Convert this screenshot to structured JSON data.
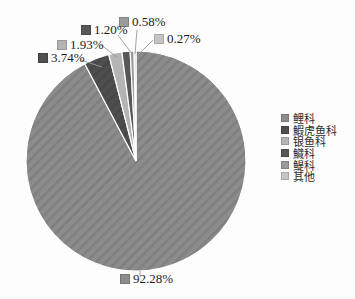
{
  "figure": {
    "background": "#fdfdfd",
    "leader_line_color": "#999999",
    "slice_border_color": "#ffffff"
  },
  "chart_data": {
    "type": "pie",
    "title": "",
    "legend_position": "right",
    "start_angle_deg": 0,
    "direction": "clockwise",
    "slices": [
      {
        "name": "鲤科",
        "value": 92.28,
        "pct_label": "92.28%",
        "color": "#8c8c8c",
        "hatched": true
      },
      {
        "name": "鰕虎鱼科",
        "value": 3.74,
        "pct_label": "3.74%",
        "color": "#4e4e4e",
        "hatched": true
      },
      {
        "name": "银鱼科",
        "value": 1.93,
        "pct_label": "1.93%",
        "color": "#b4b4b4",
        "hatched": false
      },
      {
        "name": "鱵科",
        "value": 1.2,
        "pct_label": "1.20%",
        "color": "#575757",
        "hatched": false
      },
      {
        "name": "鳀科",
        "value": 0.58,
        "pct_label": "0.58%",
        "color": "#9b9b9b",
        "hatched": false
      },
      {
        "name": "其他",
        "value": 0.27,
        "pct_label": "0.27%",
        "color": "#c5c5c5",
        "hatched": false
      }
    ]
  }
}
